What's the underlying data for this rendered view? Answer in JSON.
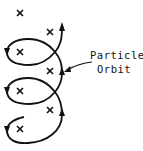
{
  "diagram": {
    "label_line1": "Particle",
    "label_line2": "Orbit",
    "stroke_color": "#111111",
    "field_marker": "x",
    "field_markers": [
      {
        "x": 20,
        "y": 13
      },
      {
        "x": 50,
        "y": 32
      },
      {
        "x": 20,
        "y": 52
      },
      {
        "x": 50,
        "y": 71
      },
      {
        "x": 20,
        "y": 91
      },
      {
        "x": 50,
        "y": 110
      },
      {
        "x": 20,
        "y": 129
      }
    ]
  }
}
